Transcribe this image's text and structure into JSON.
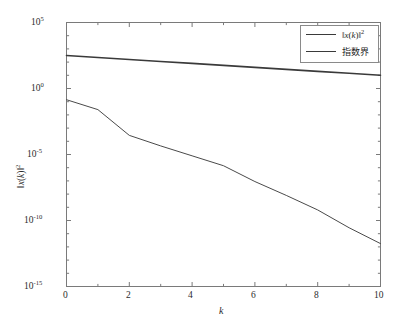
{
  "chart_data": {
    "type": "line",
    "title": "",
    "xlabel": "k",
    "ylabel": "||x(k)||^2",
    "ylabel_parts": {
      "norm_open": "‖",
      "var": "x",
      "arg": "(k)",
      "norm_close": "‖",
      "exp": "2"
    },
    "xlim": [
      0,
      10
    ],
    "ylim": [
      1e-15,
      100000.0
    ],
    "yscale": "log",
    "xscale": "linear",
    "grid": false,
    "box": true,
    "legend_position": "upper-right",
    "xticks": [
      0,
      2,
      4,
      6,
      8,
      10
    ],
    "xticklabels": [
      "0",
      "2",
      "4",
      "6",
      "8",
      "10"
    ],
    "yticks": [
      100000.0,
      1.0,
      1e-05,
      1e-10,
      1e-15
    ],
    "yticklabels": [
      "10^5",
      "10^0",
      "10^-5",
      "10^-10",
      "10^-15"
    ],
    "ytick_mantissa": "10",
    "ytick_exponents": [
      "5",
      "0",
      "-5",
      "-10",
      "-15"
    ],
    "x": [
      0,
      1,
      2,
      3,
      4,
      5,
      6,
      7,
      8,
      9,
      10
    ],
    "series": [
      {
        "name": "||x(k)||^2",
        "legend_label_parts": {
          "norm_open": "‖",
          "var": "x",
          "arg": "(k)",
          "norm_close": "‖",
          "exp": "2"
        },
        "color": "#4a4a4a",
        "linewidth": 1.0,
        "log10_values": [
          -0.85,
          -1.6,
          -3.55,
          -4.35,
          -5.1,
          -5.85,
          -7.05,
          -8.1,
          -9.2,
          -10.55,
          -11.75
        ],
        "values": [
          0.141,
          0.0251,
          0.000282,
          4.47e-05,
          7.94e-06,
          1.41e-06,
          8.91e-08,
          7.94e-09,
          6.31e-10,
          2.82e-11,
          1.78e-12
        ]
      },
      {
        "name": "指数界",
        "legend_label": "指数界",
        "color": "#3a3a3a",
        "linewidth": 1.6,
        "log10_values": [
          2.5,
          2.35,
          2.2,
          2.05,
          1.9,
          1.75,
          1.6,
          1.45,
          1.3,
          1.15,
          1.0
        ],
        "values": [
          316.2,
          223.9,
          158.5,
          112.2,
          79.4,
          56.2,
          39.8,
          28.2,
          20.0,
          14.1,
          10.0
        ]
      }
    ],
    "axes_color": "#6f6f6f",
    "background": "#ffffff"
  },
  "legend": {
    "items": [
      {
        "label_text": "||x(k)||²"
      },
      {
        "label_text": "指数界"
      }
    ]
  }
}
